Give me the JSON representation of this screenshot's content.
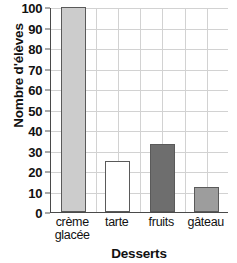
{
  "chart_data": {
    "type": "bar",
    "title": "",
    "xlabel": "Desserts",
    "ylabel": "Nombre d'élèves",
    "categories": [
      "crème glacée",
      "tarte",
      "fruits",
      "gâteau"
    ],
    "category_lines": [
      [
        "crème",
        "glacée"
      ],
      [
        "tarte"
      ],
      [
        "fruits"
      ],
      [
        "gâteau"
      ]
    ],
    "values": [
      100,
      25,
      33,
      12
    ],
    "ylim": [
      0,
      100
    ],
    "yticks": [
      0,
      10,
      20,
      30,
      40,
      50,
      60,
      70,
      80,
      90,
      100
    ],
    "ytick_labels": [
      "0",
      "10",
      "20",
      "30",
      "40",
      "50",
      "60",
      "70",
      "80",
      "90",
      "100"
    ],
    "grid": true,
    "legend": "none",
    "bar_colors": [
      "#cccccc",
      "#ffffff",
      "#6e6e6e",
      "#9d9d9d"
    ],
    "bar_edge_color": "#5a5a5a",
    "grid_color": "#d2d2d2",
    "axis_color": "#4a4a4a"
  }
}
